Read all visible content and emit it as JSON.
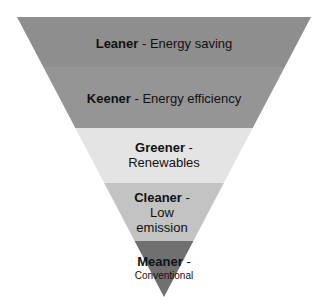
{
  "diagram": {
    "type": "inverted-pyramid",
    "levels": [
      {
        "key": "Leaner",
        "sep": " - ",
        "desc": "Energy saving",
        "color": "#8e8e8e"
      },
      {
        "key": "Keener",
        "sep": " - ",
        "desc": "Energy efficiency",
        "color": "#959595"
      },
      {
        "key": "Greener",
        "sep": " -",
        "desc": "Renewables",
        "color": "#e4e4e4"
      },
      {
        "key": "Cleaner",
        "sep": " -",
        "desc": "Low emission",
        "color": "#c3c3c3"
      },
      {
        "key": "Meaner",
        "sep": " -",
        "desc": "Conventional",
        "color": "#707070"
      }
    ]
  }
}
